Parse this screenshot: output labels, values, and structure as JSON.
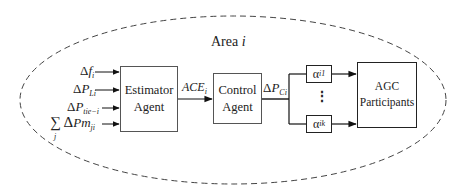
{
  "area": {
    "title": "Area",
    "index": "i"
  },
  "inputs": [
    {
      "symbol": "Δ",
      "var": "f",
      "sub": "i"
    },
    {
      "symbol": "Δ",
      "var": "P",
      "sub": "Li"
    },
    {
      "symbol": "Δ",
      "var": "P",
      "sub": "tie−i"
    },
    {
      "symbol": "∑ Δ",
      "var": "Pm",
      "sub": "ji",
      "sum_index": "j"
    }
  ],
  "estimator": {
    "line1": "Estimator",
    "line2": "Agent"
  },
  "ace": {
    "var": "ACE",
    "sub": "i"
  },
  "control": {
    "line1": "Control",
    "line2": "Agent"
  },
  "dpc": {
    "symbol": "Δ",
    "var": "P",
    "sub": "Ci"
  },
  "alpha_top": {
    "var": "α",
    "sub": "i1"
  },
  "alpha_bottom": {
    "var": "α",
    "sub": "ik"
  },
  "ellipsis": "⋮",
  "agc": {
    "line1": "AGC",
    "line2": "Participants"
  }
}
